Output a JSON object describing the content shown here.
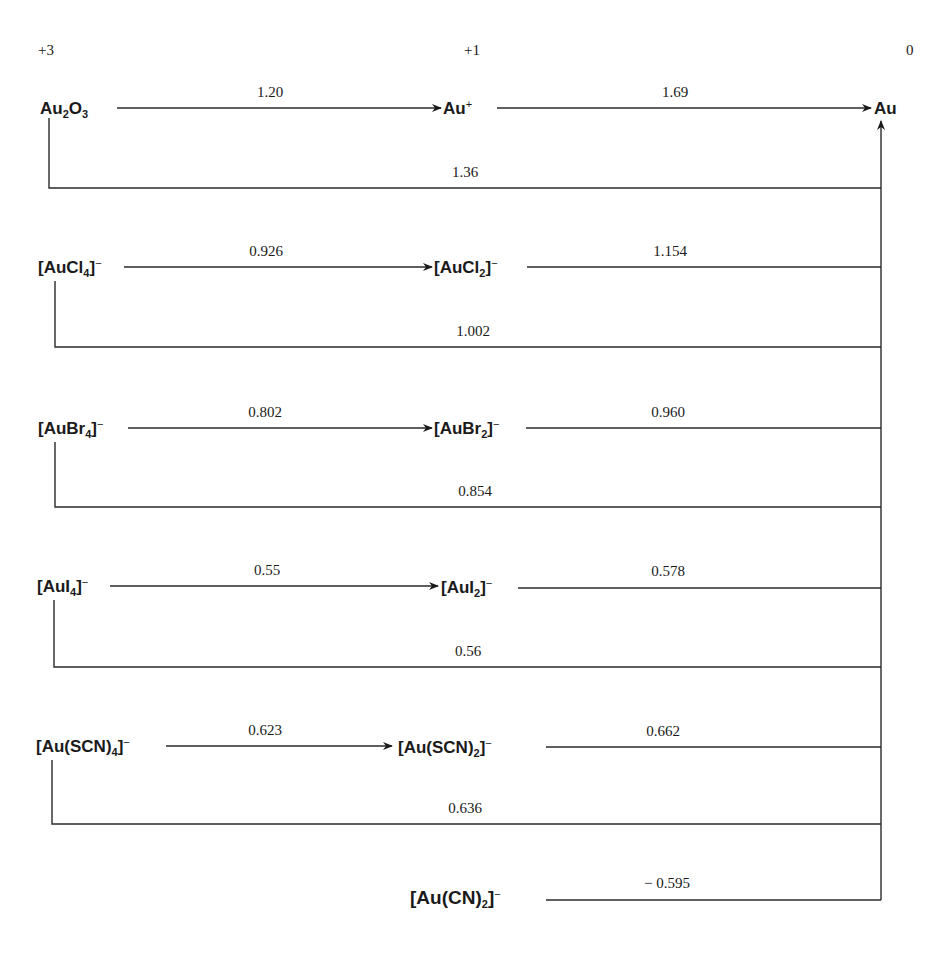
{
  "oxidation_states": [
    "+3",
    "+1",
    "0"
  ],
  "species": {
    "au2o3": {
      "base": "Au",
      "sub1": "2",
      "mid": "O",
      "sub2": "3"
    },
    "au_plus": {
      "base": "Au",
      "sup": "+"
    },
    "au": {
      "base": "Au"
    },
    "aucl4": {
      "open": "[AuCl",
      "sub": "4",
      "close": "]",
      "sup": "−"
    },
    "aucl2": {
      "open": "[AuCl",
      "sub": "2",
      "close": "]",
      "sup": "−"
    },
    "aubr4": {
      "open": "[AuBr",
      "sub": "4",
      "close": "]",
      "sup": "−"
    },
    "aubr2": {
      "open": "[AuBr",
      "sub": "2",
      "close": "]",
      "sup": "−"
    },
    "aui4": {
      "open": "[AuI",
      "sub": "4",
      "close": "]",
      "sup": "−"
    },
    "aui2": {
      "open": "[AuI",
      "sub": "2",
      "close": "]",
      "sup": "−"
    },
    "auscn4": {
      "open": "[Au(SCN)",
      "sub": "4",
      "close": "]",
      "sup": "−"
    },
    "auscn2": {
      "open": "[Au(SCN)",
      "sub": "2",
      "close": "]",
      "sup": "−"
    },
    "aucn2": {
      "open": "[Au(CN)",
      "sub": "2",
      "close": "]",
      "sup": "−"
    }
  },
  "potentials": {
    "oxide": {
      "p31": "1.20",
      "p10": "1.69",
      "p30": "1.36"
    },
    "chloride": {
      "p31": "0.926",
      "p10": "1.154",
      "p30": "1.002"
    },
    "bromide": {
      "p31": "0.802",
      "p10": "0.960",
      "p30": "0.854"
    },
    "iodide": {
      "p31": "0.55",
      "p10": "0.578",
      "p30": "0.56"
    },
    "thiocyanate": {
      "p31": "0.623",
      "p10": "0.662",
      "p30": "0.636"
    },
    "cyanide": {
      "p10": "− 0.595"
    }
  }
}
